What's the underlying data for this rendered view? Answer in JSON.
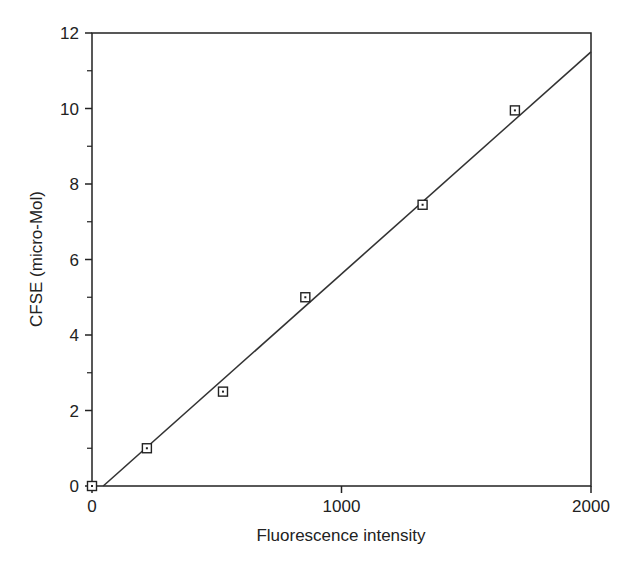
{
  "chart_data": {
    "type": "scatter",
    "title": "",
    "xlabel": "Fluorescence intensity",
    "ylabel": "CFSE (micro-Mol)",
    "xlim": [
      0,
      2000
    ],
    "ylim": [
      0,
      12
    ],
    "x_ticks": [
      0,
      1000,
      2000
    ],
    "y_ticks": [
      0,
      2,
      4,
      6,
      8,
      10,
      12
    ],
    "y_minor_ticks": [
      1,
      3,
      5,
      7,
      9,
      11
    ],
    "grid": false,
    "legend": null,
    "series": [
      {
        "name": "measured",
        "marker": "square-dot",
        "x": [
          0,
          220,
          525,
          855,
          1325,
          1695
        ],
        "y": [
          0,
          1.0,
          2.5,
          5.0,
          7.45,
          9.95
        ]
      },
      {
        "name": "linear fit",
        "type": "line",
        "x": [
          45,
          2000
        ],
        "y": [
          0,
          11.5
        ]
      }
    ],
    "colors": {
      "axis": "#222222",
      "line": "#333333",
      "marker": "#222222"
    }
  }
}
